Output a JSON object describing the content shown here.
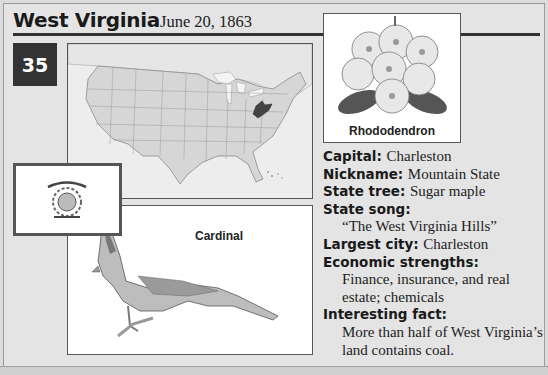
{
  "header": {
    "state_name": "West Virginia",
    "statehood_date": "June 20, 1863",
    "state_number": "35"
  },
  "images": {
    "map": {
      "label": "",
      "highlighted_state": "West Virginia",
      "highlight_color": "#555555"
    },
    "flag": {
      "label": ""
    },
    "bird": {
      "label": "Cardinal"
    },
    "flower": {
      "label": "Rhododendron"
    }
  },
  "facts": {
    "capital": {
      "label": "Capital:",
      "value": "Charleston"
    },
    "nickname": {
      "label": "Nickname:",
      "value": "Mountain State"
    },
    "tree": {
      "label": "State tree:",
      "value": "Sugar maple"
    },
    "song": {
      "label": "State song:",
      "value": "“The West Virginia Hills”"
    },
    "largest_city": {
      "label": "Largest city:",
      "value": "Charleston"
    },
    "economy": {
      "label": "Economic strengths:",
      "line1": "Finance, insurance, and real",
      "line2": "estate; chemicals"
    },
    "fact": {
      "label": "Interesting fact:",
      "line1": "More than half of West Virginia’s",
      "line2": "land contains coal."
    }
  }
}
